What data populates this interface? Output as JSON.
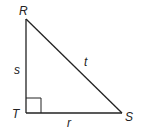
{
  "diagram": {
    "type": "right-triangle",
    "vertices": [
      {
        "id": "R",
        "label": "R",
        "x": 26,
        "y": 19
      },
      {
        "id": "T",
        "label": "T",
        "x": 26,
        "y": 113
      },
      {
        "id": "S",
        "label": "S",
        "x": 122,
        "y": 113
      }
    ],
    "sides": [
      {
        "id": "s",
        "label": "s",
        "from": "R",
        "to": "T"
      },
      {
        "id": "t",
        "label": "t",
        "from": "R",
        "to": "S"
      },
      {
        "id": "r",
        "label": "r",
        "from": "T",
        "to": "S"
      }
    ],
    "right_angle_at": "T",
    "colors": {
      "stroke": "#222222",
      "background": "#ffffff"
    }
  }
}
